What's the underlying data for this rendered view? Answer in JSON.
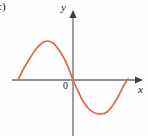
{
  "figure": {
    "part_label": "c)",
    "origin_label": "0",
    "background_color": "#fdfdfd"
  },
  "chart_data": {
    "type": "line",
    "title": "",
    "subtitle": "",
    "xlabel": "x",
    "ylabel": "y",
    "curve_color": "#e0674f",
    "axis_color": "#6b6b73",
    "grid": false,
    "legend": null,
    "annotations": [
      "0"
    ],
    "axes": {
      "x_axis": {
        "label": "x",
        "has_arrow": true,
        "arrow_direction": "right",
        "tick_labels": [],
        "pixel_y": 80,
        "pixel_x_start": 12,
        "pixel_x_end": 143
      },
      "y_axis": {
        "label": "y",
        "has_arrow": true,
        "arrow_direction": "up",
        "tick_labels": [],
        "pixel_x": 73,
        "pixel_y_start": 10,
        "pixel_y_end": 136
      }
    },
    "series": [
      {
        "name": "sine-like curve",
        "description": "One full period of a sine-shaped curve: rises to a positive maximum left of the origin, passes through the origin with negative slope, falls to a negative minimum right of the origin, then returns to the axis.",
        "points_pixel": [
          [
            18,
            80
          ],
          [
            24,
            68
          ],
          [
            30,
            58
          ],
          [
            36,
            49
          ],
          [
            42,
            43
          ],
          [
            47,
            41
          ],
          [
            53,
            43
          ],
          [
            59,
            50
          ],
          [
            65,
            60
          ],
          [
            70,
            72
          ],
          [
            73,
            80
          ],
          [
            77,
            89
          ],
          [
            83,
            101
          ],
          [
            89,
            109
          ],
          [
            95,
            113
          ],
          [
            101,
            114
          ],
          [
            107,
            112
          ],
          [
            113,
            105
          ],
          [
            119,
            95
          ],
          [
            124,
            85
          ],
          [
            128,
            79
          ]
        ],
        "zeros_pixel_x": [
          18,
          73,
          128
        ],
        "maximum_pixel": [
          47,
          41
        ],
        "minimum_pixel": [
          101,
          114
        ]
      }
    ]
  }
}
